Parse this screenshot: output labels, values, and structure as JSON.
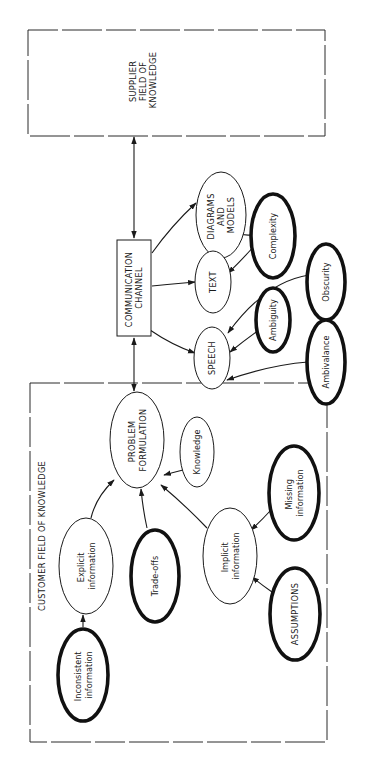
{
  "diagram": {
    "orientation": "rotated-90-ccw",
    "supplier": {
      "lines": [
        "SUPPLIER",
        "FIELD OF",
        "KNOWLEDGE"
      ]
    },
    "customer": {
      "label": "CUSTOMER FIELD OF KNOWLEDGE"
    },
    "channel": {
      "lines": [
        "COMMUNICATION",
        "CHANNEL"
      ]
    },
    "nodes": {
      "problem_formulation": {
        "lines": [
          "PROBLEM",
          "FORMULATION"
        ],
        "style": "thin"
      },
      "knowledge": {
        "lines": [
          "Knowledge"
        ],
        "style": "thin"
      },
      "explicit_information": {
        "lines": [
          "Explicit",
          "information"
        ],
        "style": "thin"
      },
      "trade_offs": {
        "lines": [
          "Trade-offs"
        ],
        "style": "thick"
      },
      "implicit_information": {
        "lines": [
          "Implicit",
          "information"
        ],
        "style": "thin"
      },
      "missing_information": {
        "lines": [
          "Missing",
          "information"
        ],
        "style": "thick"
      },
      "assumptions": {
        "lines": [
          "ASSUMPTIONS"
        ],
        "style": "thick"
      },
      "inconsistent_information": {
        "lines": [
          "Inconsistent",
          "information"
        ],
        "style": "thick"
      },
      "diagrams_and_models": {
        "lines": [
          "DIAGRAMS",
          "AND",
          "MODELS"
        ],
        "style": "thin"
      },
      "text": {
        "lines": [
          "TEXT"
        ],
        "style": "thin"
      },
      "speech": {
        "lines": [
          "SPEECH"
        ],
        "style": "thin"
      },
      "complexity": {
        "lines": [
          "Complexity"
        ],
        "style": "thick"
      },
      "ambiguity": {
        "lines": [
          "Ambiguity"
        ],
        "style": "thick"
      },
      "obscurity": {
        "lines": [
          "Obscurity"
        ],
        "style": "thick"
      },
      "ambivalance": {
        "lines": [
          "Ambivalance"
        ],
        "style": "thick"
      }
    },
    "edges": [
      {
        "from": "channel",
        "to": "supplier",
        "type": "bidirectional"
      },
      {
        "from": "channel",
        "to": "problem_formulation",
        "type": "bidirectional"
      },
      {
        "from": "channel",
        "to": "diagrams_and_models",
        "type": "directed"
      },
      {
        "from": "channel",
        "to": "text",
        "type": "directed"
      },
      {
        "from": "channel",
        "to": "speech",
        "type": "directed"
      },
      {
        "from": "complexity",
        "to": "diagrams_and_models",
        "type": "directed"
      },
      {
        "from": "complexity",
        "to": "text",
        "type": "directed"
      },
      {
        "from": "obscurity",
        "to": "speech",
        "type": "directed"
      },
      {
        "from": "ambiguity",
        "to": "speech",
        "type": "directed"
      },
      {
        "from": "ambivalance",
        "to": "speech",
        "type": "directed"
      },
      {
        "from": "explicit_information",
        "to": "problem_formulation",
        "type": "directed"
      },
      {
        "from": "trade_offs",
        "to": "problem_formulation",
        "type": "directed"
      },
      {
        "from": "implicit_information",
        "to": "problem_formulation",
        "type": "directed"
      },
      {
        "from": "knowledge",
        "to": "problem_formulation",
        "type": "directed"
      },
      {
        "from": "missing_information",
        "to": "implicit_information",
        "type": "directed"
      },
      {
        "from": "assumptions",
        "to": "implicit_information",
        "type": "directed"
      },
      {
        "from": "inconsistent_information",
        "to": "explicit_information",
        "type": "directed"
      }
    ]
  }
}
